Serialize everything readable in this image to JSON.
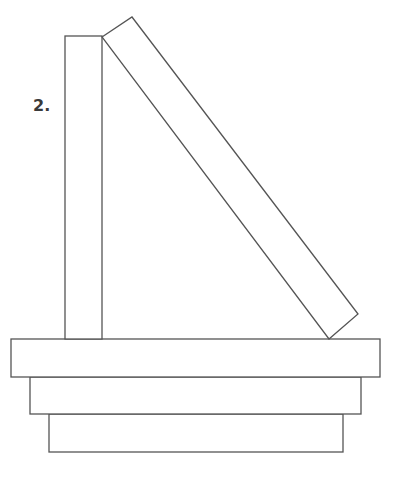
{
  "figure": {
    "label": "2.",
    "stroke_color": "#555555",
    "fill_color": "#ffffff",
    "shapes": {
      "vertical_block": {
        "x": 65,
        "y": 36,
        "width": 37,
        "height": 303
      },
      "tilted_block": {
        "points": [
          [
            102,
            37
          ],
          [
            132,
            17
          ],
          [
            358,
            314
          ],
          [
            329,
            339
          ]
        ]
      },
      "base_slabs": [
        {
          "x": 11,
          "y": 339,
          "width": 369,
          "height": 38
        },
        {
          "x": 30,
          "y": 377,
          "width": 331,
          "height": 37
        },
        {
          "x": 49,
          "y": 414,
          "width": 294,
          "height": 38
        }
      ]
    }
  }
}
